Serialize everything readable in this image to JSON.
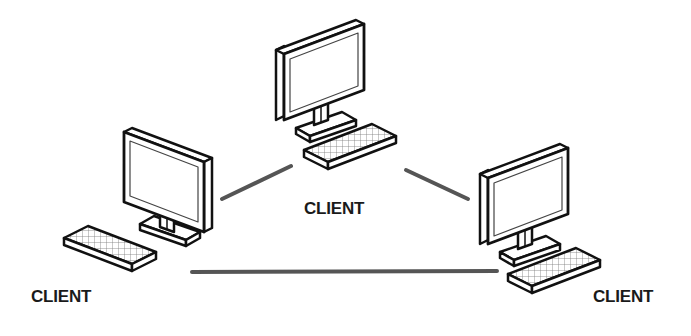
{
  "diagram": {
    "type": "peer-to-peer network",
    "colors": {
      "background": "#ffffff",
      "outline": "#111111",
      "fill": "#ffffff",
      "connection": "#555555",
      "label": "#1a1a1a"
    },
    "nodes": [
      {
        "id": "client-top",
        "label": "CLIENT"
      },
      {
        "id": "client-left",
        "label": "CLIENT"
      },
      {
        "id": "client-right",
        "label": "CLIENT"
      }
    ],
    "connections": [
      {
        "from": "client-left",
        "to": "client-top"
      },
      {
        "from": "client-top",
        "to": "client-right"
      },
      {
        "from": "client-left",
        "to": "client-right"
      }
    ]
  }
}
